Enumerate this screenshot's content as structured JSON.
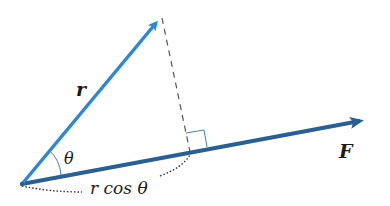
{
  "diagram": {
    "labels": {
      "r_vector": "r",
      "f_vector": "F",
      "angle": "θ",
      "projection": "r cos θ"
    },
    "colors": {
      "r_vector": "#2e86d4",
      "f_vector": "#2a5f8f",
      "dashed_perpendicular": "#555555",
      "right_angle_marker": "#4a7fb0",
      "angle_arc": "#4a7fb0",
      "dotted_brace": "#333333",
      "text": "#1a1a1a"
    },
    "geometry_semantics": {
      "angle_between_r_and_F": "θ",
      "perpendicular_dropped_from": "tip of r",
      "perpendicular_onto": "line of F",
      "right_angle_marked": true
    }
  }
}
